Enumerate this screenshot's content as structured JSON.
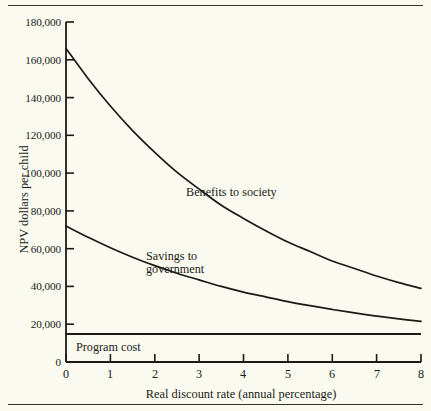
{
  "figure": {
    "name": "npv-discount-rate-figure",
    "background_color": "#fbfaf0",
    "ink_color": "#1a1a16"
  },
  "axes": {
    "x_title": "Real discount rate (annual percentage)",
    "y_title": "NPV dollars per child",
    "x_ticks": [
      "0",
      "1",
      "2",
      "3",
      "4",
      "5",
      "6",
      "7",
      "8"
    ],
    "y_ticks": [
      "0",
      "20,000",
      "40,000",
      "60,000",
      "80,000",
      "100,000",
      "120,000",
      "140,000",
      "160,000",
      "180,000"
    ]
  },
  "annotations": {
    "benefits": "Benefits to society",
    "savings": "Savings to\ngovernment",
    "savings_line1": "Savings to",
    "savings_line2": "government",
    "program": "Program cost"
  },
  "chart_data": {
    "type": "line",
    "title": "",
    "xlabel": "Real discount rate (annual percentage)",
    "ylabel": "NPV dollars per child",
    "xlim": [
      0,
      8
    ],
    "ylim": [
      0,
      180000
    ],
    "xticks": [
      0,
      1,
      2,
      3,
      4,
      5,
      6,
      7,
      8
    ],
    "yticks": [
      0,
      20000,
      40000,
      60000,
      80000,
      100000,
      120000,
      140000,
      160000,
      180000
    ],
    "grid": false,
    "legend": "inline-annotations",
    "x": [
      0,
      0.5,
      1,
      1.5,
      2,
      2.5,
      3,
      3.5,
      4,
      4.5,
      5,
      5.5,
      6,
      6.5,
      7,
      7.5,
      8
    ],
    "series": [
      {
        "name": "Benefits to society",
        "label_position": {
          "x": 2.9,
          "y": 88000
        },
        "values": [
          166000,
          150000,
          135500,
          122500,
          111000,
          100500,
          91500,
          83000,
          76000,
          69500,
          63500,
          58500,
          53500,
          49500,
          45500,
          42000,
          39000
        ]
      },
      {
        "name": "Savings to government",
        "label_position": {
          "x": 1.9,
          "y": 56000
        },
        "values": [
          72000,
          66000,
          60500,
          55500,
          51000,
          47000,
          43500,
          40000,
          37000,
          34500,
          32000,
          29800,
          27800,
          26000,
          24300,
          22800,
          21500
        ]
      },
      {
        "name": "Program cost",
        "label_position": {
          "x": 0.3,
          "y": 9500
        },
        "constant": 14800,
        "values": [
          14800,
          14800,
          14800,
          14800,
          14800,
          14800,
          14800,
          14800,
          14800,
          14800,
          14800,
          14800,
          14800,
          14800,
          14800,
          14800,
          14800
        ]
      }
    ]
  }
}
